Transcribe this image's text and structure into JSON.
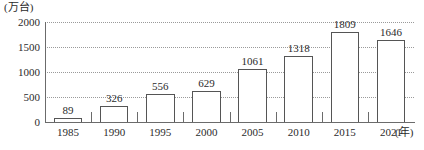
{
  "chart_data": {
    "type": "bar",
    "title": "",
    "subtitle": "",
    "xlabel": "(年)",
    "ylabel": "(万台)",
    "categories": [
      "1985",
      "1990",
      "1995",
      "2000",
      "2005",
      "2010",
      "2015",
      "2021"
    ],
    "values": [
      89,
      326,
      556,
      629,
      1061,
      1318,
      1809,
      1646
    ],
    "value_labels": [
      "89",
      "326",
      "556",
      "629",
      "1061",
      "1318",
      "1809",
      "1646"
    ],
    "ylim": [
      0,
      2000
    ],
    "yticks": [
      0,
      500,
      1000,
      1500,
      2000
    ],
    "ytick_labels": [
      "0",
      "500",
      "1000",
      "1500",
      "2000"
    ],
    "grid": true,
    "grid_style": "dotted",
    "legend": null,
    "legend_position": "none",
    "series": [
      {
        "name": "",
        "values": [
          89,
          326,
          556,
          629,
          1061,
          1318,
          1809,
          1646
        ]
      }
    ],
    "colors": {
      "bar_fill": "#ffffff",
      "bar_stroke": "#555555",
      "axis": "#6b6b6b",
      "grid": "#9a9a9a",
      "text": "#2b2b2b"
    }
  }
}
